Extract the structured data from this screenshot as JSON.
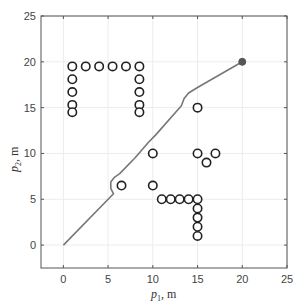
{
  "chart_data": {
    "type": "scatter",
    "title": "",
    "xlabel": "p1, m",
    "ylabel": "p2, m",
    "xlabel_parts": {
      "base": "p",
      "sub": "1",
      "unit": ", m"
    },
    "ylabel_parts": {
      "base": "p",
      "sub": "2",
      "unit": ", m"
    },
    "xlim": [
      -2.5,
      25
    ],
    "ylim": [
      -2.5,
      25
    ],
    "xticks": [
      0,
      5,
      10,
      15,
      20,
      25
    ],
    "yticks": [
      0,
      5,
      10,
      15,
      20,
      25
    ],
    "grid": true,
    "legend": null,
    "series": [
      {
        "name": "obstacles",
        "kind": "open-circle-markers",
        "color": "#222222",
        "points": [
          [
            1,
            19.5
          ],
          [
            2.5,
            19.5
          ],
          [
            4,
            19.5
          ],
          [
            5.5,
            19.5
          ],
          [
            7,
            19.5
          ],
          [
            8.5,
            19.5
          ],
          [
            1,
            18.1
          ],
          [
            1,
            16.7
          ],
          [
            1,
            15.3
          ],
          [
            1,
            14.5
          ],
          [
            8.5,
            18.1
          ],
          [
            8.5,
            16.7
          ],
          [
            8.5,
            15.3
          ],
          [
            8.5,
            14.5
          ],
          [
            15,
            15
          ],
          [
            10,
            10
          ],
          [
            15,
            10
          ],
          [
            16,
            9
          ],
          [
            17,
            10
          ],
          [
            6.5,
            6.5
          ],
          [
            10,
            6.5
          ],
          [
            11,
            5
          ],
          [
            12,
            5
          ],
          [
            13,
            5
          ],
          [
            14,
            5
          ],
          [
            15,
            5
          ],
          [
            15,
            4
          ],
          [
            15,
            3
          ],
          [
            15,
            2
          ],
          [
            15,
            1
          ]
        ]
      },
      {
        "name": "path",
        "kind": "line",
        "color": "#777777",
        "points": [
          [
            0,
            0
          ],
          [
            5.6,
            5.6
          ],
          [
            5.3,
            6.2
          ],
          [
            5.3,
            6.9
          ],
          [
            5.7,
            7.4
          ],
          [
            6.3,
            7.8
          ],
          [
            8,
            9.5
          ],
          [
            9.5,
            11.2
          ],
          [
            10.3,
            12
          ],
          [
            13.2,
            15.2
          ],
          [
            13.5,
            16
          ],
          [
            14,
            16.6
          ],
          [
            15,
            17.2
          ],
          [
            20,
            20
          ]
        ]
      },
      {
        "name": "goal",
        "kind": "filled-circle-marker",
        "color": "#555555",
        "points": [
          [
            20,
            20
          ]
        ]
      }
    ]
  }
}
